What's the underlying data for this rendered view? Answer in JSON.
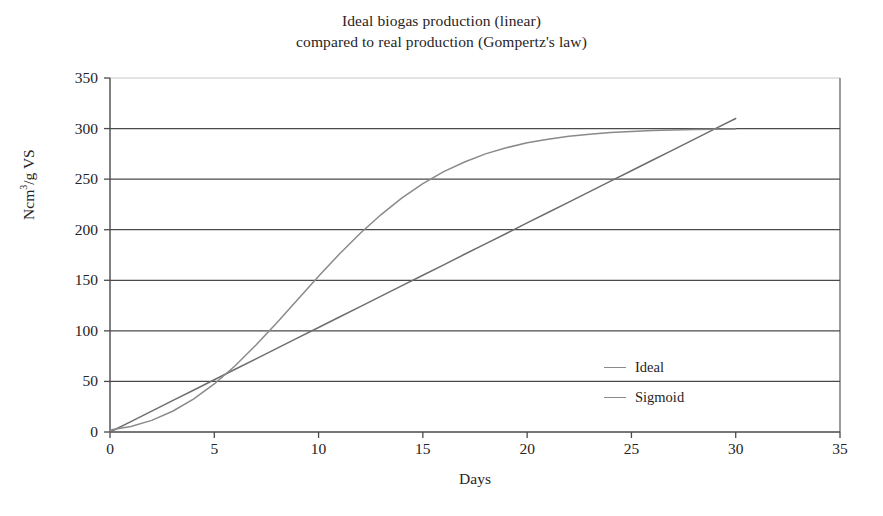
{
  "chart_data": {
    "type": "line",
    "title": "Ideal biogas production (linear)\ncompared to real production (Gompertz's law)",
    "title_line1": "Ideal biogas production (linear)",
    "title_line2": "compared to real production (Gompertz's law)",
    "xlabel": "Days",
    "ylabel_text": "Ncm",
    "ylabel_sup": "3",
    "ylabel_rest": "/g VS",
    "ylabel_full": "Ncm3/g VS",
    "xlim": [
      0,
      35
    ],
    "ylim": [
      0,
      350
    ],
    "xticks": [
      "0",
      "5",
      "10",
      "15",
      "20",
      "25",
      "30",
      "35"
    ],
    "xtick_values": [
      0,
      5,
      10,
      15,
      20,
      25,
      30,
      35
    ],
    "yticks": [
      "0",
      "50",
      "100",
      "150",
      "200",
      "250",
      "300",
      "350"
    ],
    "ytick_values": [
      0,
      50,
      100,
      150,
      200,
      250,
      300,
      350
    ],
    "grid": "horizontal",
    "legend_position": "inside-right",
    "x": [
      0,
      1,
      2,
      3,
      4,
      5,
      6,
      7,
      8,
      9,
      10,
      11,
      12,
      13,
      14,
      15,
      16,
      17,
      18,
      19,
      20,
      21,
      22,
      23,
      24,
      25,
      26,
      27,
      28,
      29,
      30
    ],
    "series": [
      {
        "name": "Ideal",
        "color": "#6e6e6e",
        "values": [
          0,
          10.3,
          20.7,
          31.0,
          41.3,
          51.7,
          62.0,
          72.3,
          82.7,
          93.0,
          103.3,
          113.7,
          124.0,
          134.3,
          144.7,
          155.0,
          165.3,
          175.7,
          186.0,
          196.3,
          206.7,
          217.0,
          227.3,
          237.7,
          248.0,
          258.3,
          268.7,
          279.0,
          289.3,
          299.7,
          310.0
        ]
      },
      {
        "name": "Sigmoid",
        "color": "#8a8a8a",
        "values": [
          2.0,
          5.5,
          11.5,
          20.5,
          32.5,
          47.5,
          65.5,
          86.0,
          108.0,
          131.0,
          154.0,
          176.0,
          196.5,
          215.0,
          231.5,
          245.5,
          257.5,
          267.0,
          275.0,
          281.0,
          286.0,
          289.5,
          292.5,
          294.5,
          296.0,
          297.2,
          298.0,
          298.6,
          299.0,
          299.3,
          299.5
        ]
      }
    ],
    "legend": [
      {
        "label": "Ideal",
        "color": "#8a8a8a"
      },
      {
        "label": "Sigmoid",
        "color": "#8a8a8a"
      }
    ]
  },
  "colors": {
    "background": "#ffffff",
    "axis": "#4a4a4a",
    "grid": "#4a4a4a",
    "grid_top": "#c9c9c9",
    "text": "#272425"
  }
}
